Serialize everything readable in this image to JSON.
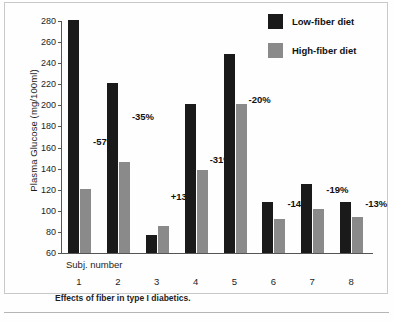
{
  "chart_data": {
    "type": "bar",
    "title": "",
    "caption": "Effects of fiber in type I diabetics.",
    "xlabel": "Subj. number",
    "ylabel": "Plasma Glucose (mg/100ml)",
    "categories": [
      "1",
      "2",
      "3",
      "4",
      "5",
      "6",
      "7",
      "8"
    ],
    "ylim": [
      60,
      280
    ],
    "yticks": [
      280,
      260,
      240,
      220,
      200,
      180,
      160,
      140,
      120,
      100,
      80,
      60
    ],
    "grid": false,
    "legend_position": "top-right",
    "series": [
      {
        "name": "Low-fiber diet",
        "color": "#1a1a1a",
        "values": [
          281,
          221,
          77,
          201,
          249,
          108,
          125,
          108
        ]
      },
      {
        "name": "High-fiber diet",
        "color": "#8a8a8a",
        "values": [
          121,
          146,
          86,
          139,
          201,
          92,
          102,
          94
        ]
      }
    ],
    "annotations": [
      "-57%",
      "-35%",
      "+13%",
      "-31%",
      "-20%",
      "-14%",
      "-19%",
      "-13%"
    ]
  },
  "legend": {
    "items": [
      {
        "label": "Low-fiber diet",
        "color": "#1a1a1a"
      },
      {
        "label": "High-fiber diet",
        "color": "#8a8a8a"
      }
    ]
  }
}
